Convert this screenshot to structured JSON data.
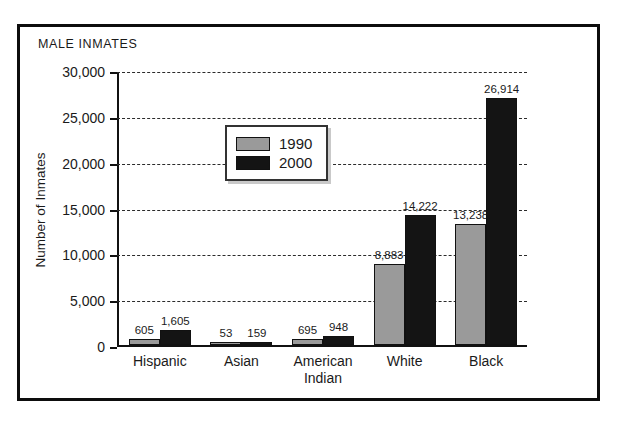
{
  "chart_data": {
    "type": "bar",
    "title": "MALE INMATES",
    "xlabel": "",
    "ylabel": "Number of Inmates",
    "categories": [
      "Hispanic",
      "Asian",
      "American Indian",
      "White",
      "Black"
    ],
    "series": [
      {
        "name": "1990",
        "color": "#9a9a9a",
        "values": [
          605,
          53,
          695,
          8883,
          13238
        ]
      },
      {
        "name": "2000",
        "color": "#141414",
        "values": [
          1605,
          159,
          948,
          14222,
          26914
        ]
      }
    ],
    "value_labels": {
      "1990": [
        "605",
        "53",
        "695",
        "8,883",
        "13,238"
      ],
      "2000": [
        "1,605",
        "159",
        "948",
        "14,222",
        "26,914"
      ]
    },
    "ylim": [
      0,
      30000
    ],
    "yticks": [
      0,
      5000,
      10000,
      15000,
      20000,
      25000,
      30000
    ],
    "ytick_labels": [
      "0",
      "5,000",
      "10,000",
      "15,000",
      "20,000",
      "25,000",
      "30,000"
    ],
    "grid": "horizontal-dashed",
    "legend_position": "upper-left-inside",
    "legend_entries": [
      "1990",
      "2000"
    ]
  },
  "category_lines": [
    [
      "Hispanic"
    ],
    [
      "Asian"
    ],
    [
      "American",
      "Indian"
    ],
    [
      "White"
    ],
    [
      "Black"
    ]
  ]
}
